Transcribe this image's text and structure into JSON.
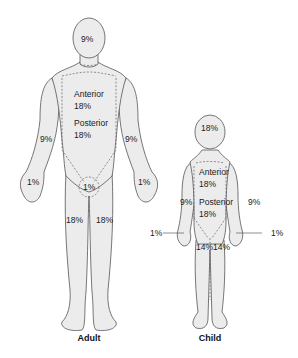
{
  "figure": {
    "adult": {
      "caption": "Adult",
      "labels": {
        "head": "9%",
        "anterior_title": "Anterior",
        "anterior_value": "18%",
        "posterior_title": "Posterior",
        "posterior_value": "18%",
        "left_arm": "9%",
        "right_arm": "9%",
        "left_hand": "1%",
        "right_hand": "1%",
        "perineum": "1%",
        "left_leg": "18%",
        "right_leg": "18%"
      }
    },
    "child": {
      "caption": "Child",
      "labels": {
        "head": "18%",
        "anterior_title": "Anterior",
        "anterior_value": "18%",
        "posterior_title": "Posterior",
        "posterior_value": "18%",
        "left_arm": "9%",
        "right_arm": "9%",
        "left_hand": "1%",
        "right_hand": "1%",
        "left_leg": "14%",
        "right_leg": "14%"
      }
    }
  }
}
